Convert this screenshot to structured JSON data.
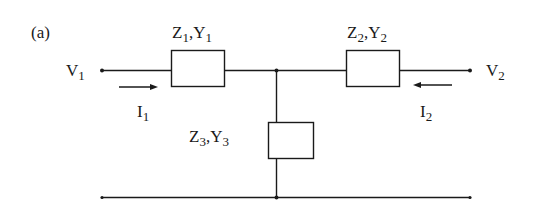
{
  "figure": {
    "panel_label": "(a)"
  },
  "labels": {
    "v1": {
      "main": "V",
      "sub": "1"
    },
    "v2": {
      "main": "V",
      "sub": "2"
    },
    "i1": {
      "main": "I",
      "sub": "1"
    },
    "i2": {
      "main": "I",
      "sub": "2"
    },
    "z1y1": {
      "z": "Z",
      "zsub": "1",
      "sep": ",",
      "y": "Y",
      "ysub": "1"
    },
    "z2y2": {
      "z": "Z",
      "zsub": "2",
      "sep": ",",
      "y": "Y",
      "ysub": "2"
    },
    "z3y3": {
      "z": "Z",
      "zsub": "3",
      "sep": ",",
      "y": "Y",
      "ysub": "3"
    }
  },
  "components": [
    {
      "id": "Z1",
      "type": "impedance",
      "position": "series-left"
    },
    {
      "id": "Z2",
      "type": "impedance",
      "position": "series-right"
    },
    {
      "id": "Z3",
      "type": "impedance",
      "position": "shunt"
    }
  ],
  "currents": [
    {
      "id": "I1",
      "direction": "right"
    },
    {
      "id": "I2",
      "direction": "left"
    }
  ],
  "colors": {
    "line": "#1a1a1a",
    "background": "#ffffff"
  }
}
